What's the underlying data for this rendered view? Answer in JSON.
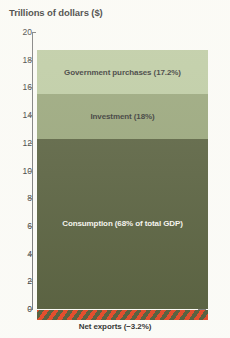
{
  "chart_data": {
    "type": "bar",
    "title": "Trillions of dollars ($)",
    "xlabel": "",
    "ylabel": "Trillions of dollars ($)",
    "ylim": [
      0,
      20
    ],
    "ytick_labels": [
      "20",
      "18",
      "16",
      "14",
      "12",
      "10",
      "8",
      "6",
      "4",
      "2",
      "0"
    ],
    "ytick_values": [
      20,
      18,
      16,
      14,
      12,
      10,
      8,
      6,
      4,
      2,
      0
    ],
    "grid": false,
    "legend": "none",
    "categories": [
      "GDP components"
    ],
    "stacked": true,
    "series": [
      {
        "name": "Consumption",
        "label": "Consumption (68% of total GDP)",
        "percent": 68,
        "start": 0,
        "end": 12.3,
        "values": [
          12.3
        ],
        "color": "#47502c",
        "label_color": "light"
      },
      {
        "name": "Investment",
        "label": "Investment (18%)",
        "percent": 18,
        "start": 12.3,
        "end": 15.5,
        "values": [
          3.2
        ],
        "color": "#8d9c6d",
        "label_color": "dark"
      },
      {
        "name": "Government purchases",
        "label": "Government purchases (17.2%)",
        "percent": 17.2,
        "start": 15.5,
        "end": 18.7,
        "values": [
          3.2
        ],
        "color": "#b6c69a",
        "label_color": "dark"
      }
    ],
    "negative_component": {
      "name": "Net exports",
      "label": "Net exports (−3.2%)",
      "percent": -3.2,
      "value": -0.6,
      "color_a": "#e03a16",
      "color_b": "#47502c",
      "pattern": "diagonal-stripes"
    },
    "annotations": []
  }
}
